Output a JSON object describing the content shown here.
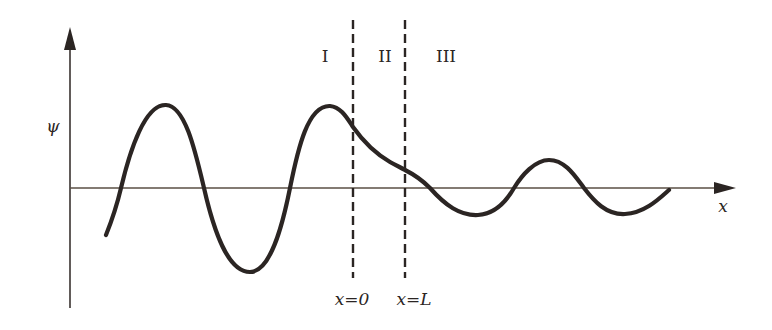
{
  "diagram": {
    "type": "wavefunction-barrier-tunneling",
    "axes": {
      "y_label": "ψ",
      "x_label": "x"
    },
    "regions": [
      {
        "id": "region-1",
        "label": "I"
      },
      {
        "id": "region-2",
        "label": "II"
      },
      {
        "id": "region-3",
        "label": "III"
      }
    ],
    "boundaries": [
      {
        "id": "boundary-left",
        "label": "x=0"
      },
      {
        "id": "boundary-right",
        "label": "x=L"
      }
    ],
    "colors": {
      "ink": "#2b2523",
      "axis": "#3a3330",
      "background": "#ffffff"
    }
  }
}
